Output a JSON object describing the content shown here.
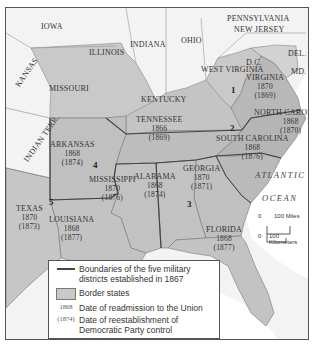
{
  "map": {
    "states": [
      {
        "name": "IOWA",
        "type": "other"
      },
      {
        "name": "ILLINOIS",
        "type": "other"
      },
      {
        "name": "INDIANA",
        "type": "other"
      },
      {
        "name": "OHIO",
        "type": "other"
      },
      {
        "name": "PENNSYLVANIA",
        "type": "other"
      },
      {
        "name": "NEW JERSEY",
        "type": "other"
      },
      {
        "name": "DEL.",
        "type": "border"
      },
      {
        "name": "MD.",
        "type": "border"
      },
      {
        "name": "KANSAS",
        "type": "other"
      },
      {
        "name": "MISSOURI",
        "type": "border"
      },
      {
        "name": "KENTUCKY",
        "type": "border"
      },
      {
        "name": "WEST VIRGINIA",
        "type": "border"
      },
      {
        "name": "D.C.",
        "type": "other"
      },
      {
        "name": "INDIAN TERR.",
        "type": "other"
      }
    ],
    "confederate_states": [
      {
        "name": "VIRGINIA",
        "readmitted": "1870",
        "democratic_control": "(1869)",
        "district": "1"
      },
      {
        "name": "NORTH CAROLINA",
        "readmitted": "1868",
        "democratic_control": "(1870)",
        "district": "2"
      },
      {
        "name": "SOUTH CAROLINA",
        "readmitted": "1868",
        "democratic_control": "(1876)",
        "district": "2"
      },
      {
        "name": "TENNESSEE",
        "readmitted": "1866",
        "democratic_control": "(1869)",
        "district": ""
      },
      {
        "name": "GEORGIA",
        "readmitted": "1870",
        "democratic_control": "(1871)",
        "district": "3"
      },
      {
        "name": "ALABAMA",
        "readmitted": "1868",
        "democratic_control": "(1874)",
        "district": "3"
      },
      {
        "name": "FLORIDA",
        "readmitted": "1868",
        "democratic_control": "(1877)",
        "district": "3"
      },
      {
        "name": "MISSISSIPPI",
        "readmitted": "1870",
        "democratic_control": "(1876)",
        "district": "4"
      },
      {
        "name": "ARKANSAS",
        "readmitted": "1868",
        "democratic_control": "(1874)",
        "district": "4"
      },
      {
        "name": "LOUISIANA",
        "readmitted": "1868",
        "democratic_control": "(1877)",
        "district": "5"
      },
      {
        "name": "TEXAS",
        "readmitted": "1870",
        "democratic_control": "(1873)",
        "district": "5"
      }
    ],
    "district_numbers": [
      "1",
      "2",
      "3",
      "4",
      "5"
    ],
    "ocean": {
      "line1": "ATLANTIC",
      "line2": "OCEAN"
    },
    "scale": {
      "zero": "0",
      "miles": "100 Miles",
      "km": "100 Kilometers"
    },
    "colors": {
      "border_states": "#c9c9c9",
      "confederate": "#bdbdbd",
      "other_states": "#f4f4f4",
      "ocean": "#ffffff",
      "district_line": "#444444"
    }
  },
  "legend": {
    "items": [
      {
        "key": "line",
        "text": "Boundaries of the five military districts established in 1867"
      },
      {
        "key": "box",
        "text": "Border states"
      },
      {
        "key": "1868",
        "text": "Date of readmission to the Union"
      },
      {
        "key": "(1874)",
        "text": "Date of reestablishment of Democratic Party control"
      }
    ]
  }
}
